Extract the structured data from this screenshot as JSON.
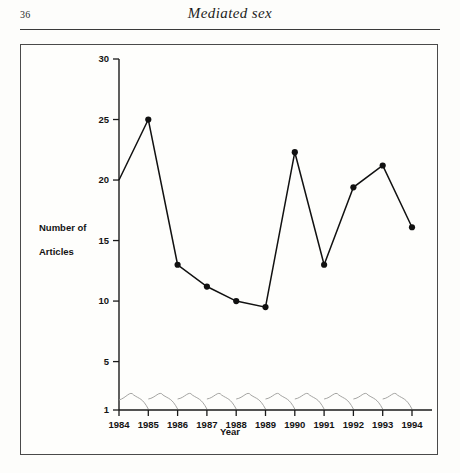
{
  "page": {
    "number": "36",
    "running_head": "Mediated sex"
  },
  "figure": {
    "ylabel_line1": "Number of",
    "ylabel_line2": "Articles"
  },
  "chart_data": {
    "type": "line",
    "title": "",
    "xlabel": "Year",
    "ylabel": "Number of Articles",
    "categories": [
      "1984",
      "1985",
      "1986",
      "1987",
      "1988",
      "1989",
      "1990",
      "1991",
      "1992",
      "1993",
      "1994"
    ],
    "x": [
      1984,
      1985,
      1986,
      1987,
      1988,
      1989,
      1990,
      1991,
      1992,
      1993,
      1994
    ],
    "values": [
      20,
      25,
      13,
      11.2,
      10,
      9.5,
      22.3,
      13,
      19.4,
      21.2,
      16.1
    ],
    "series": [
      {
        "name": "Number of Articles",
        "values": [
          20,
          25,
          13,
          11.2,
          10,
          9.5,
          22.3,
          13,
          19.4,
          21.2,
          16.1
        ],
        "color": "#111111",
        "marker": "filled-circle"
      }
    ],
    "ylim": [
      1,
      30
    ],
    "yticks": [
      1,
      5,
      10,
      15,
      20,
      25,
      30
    ],
    "ytick_labels": [
      "1",
      "5",
      "10",
      "15",
      "20",
      "25",
      "30"
    ],
    "xticks": [
      1984,
      1985,
      1986,
      1987,
      1988,
      1989,
      1990,
      1991,
      1992,
      1993,
      1994
    ],
    "xtick_labels": [
      "1984",
      "1985",
      "1986",
      "1987",
      "1988",
      "1989",
      "1990",
      "1991",
      "1992",
      "1993",
      "1994"
    ],
    "grid": false,
    "legend": "none",
    "line_color": "#111111",
    "marker_color": "#111111",
    "artifact_note": "faint grey wavy scan bleed-through near baseline"
  }
}
